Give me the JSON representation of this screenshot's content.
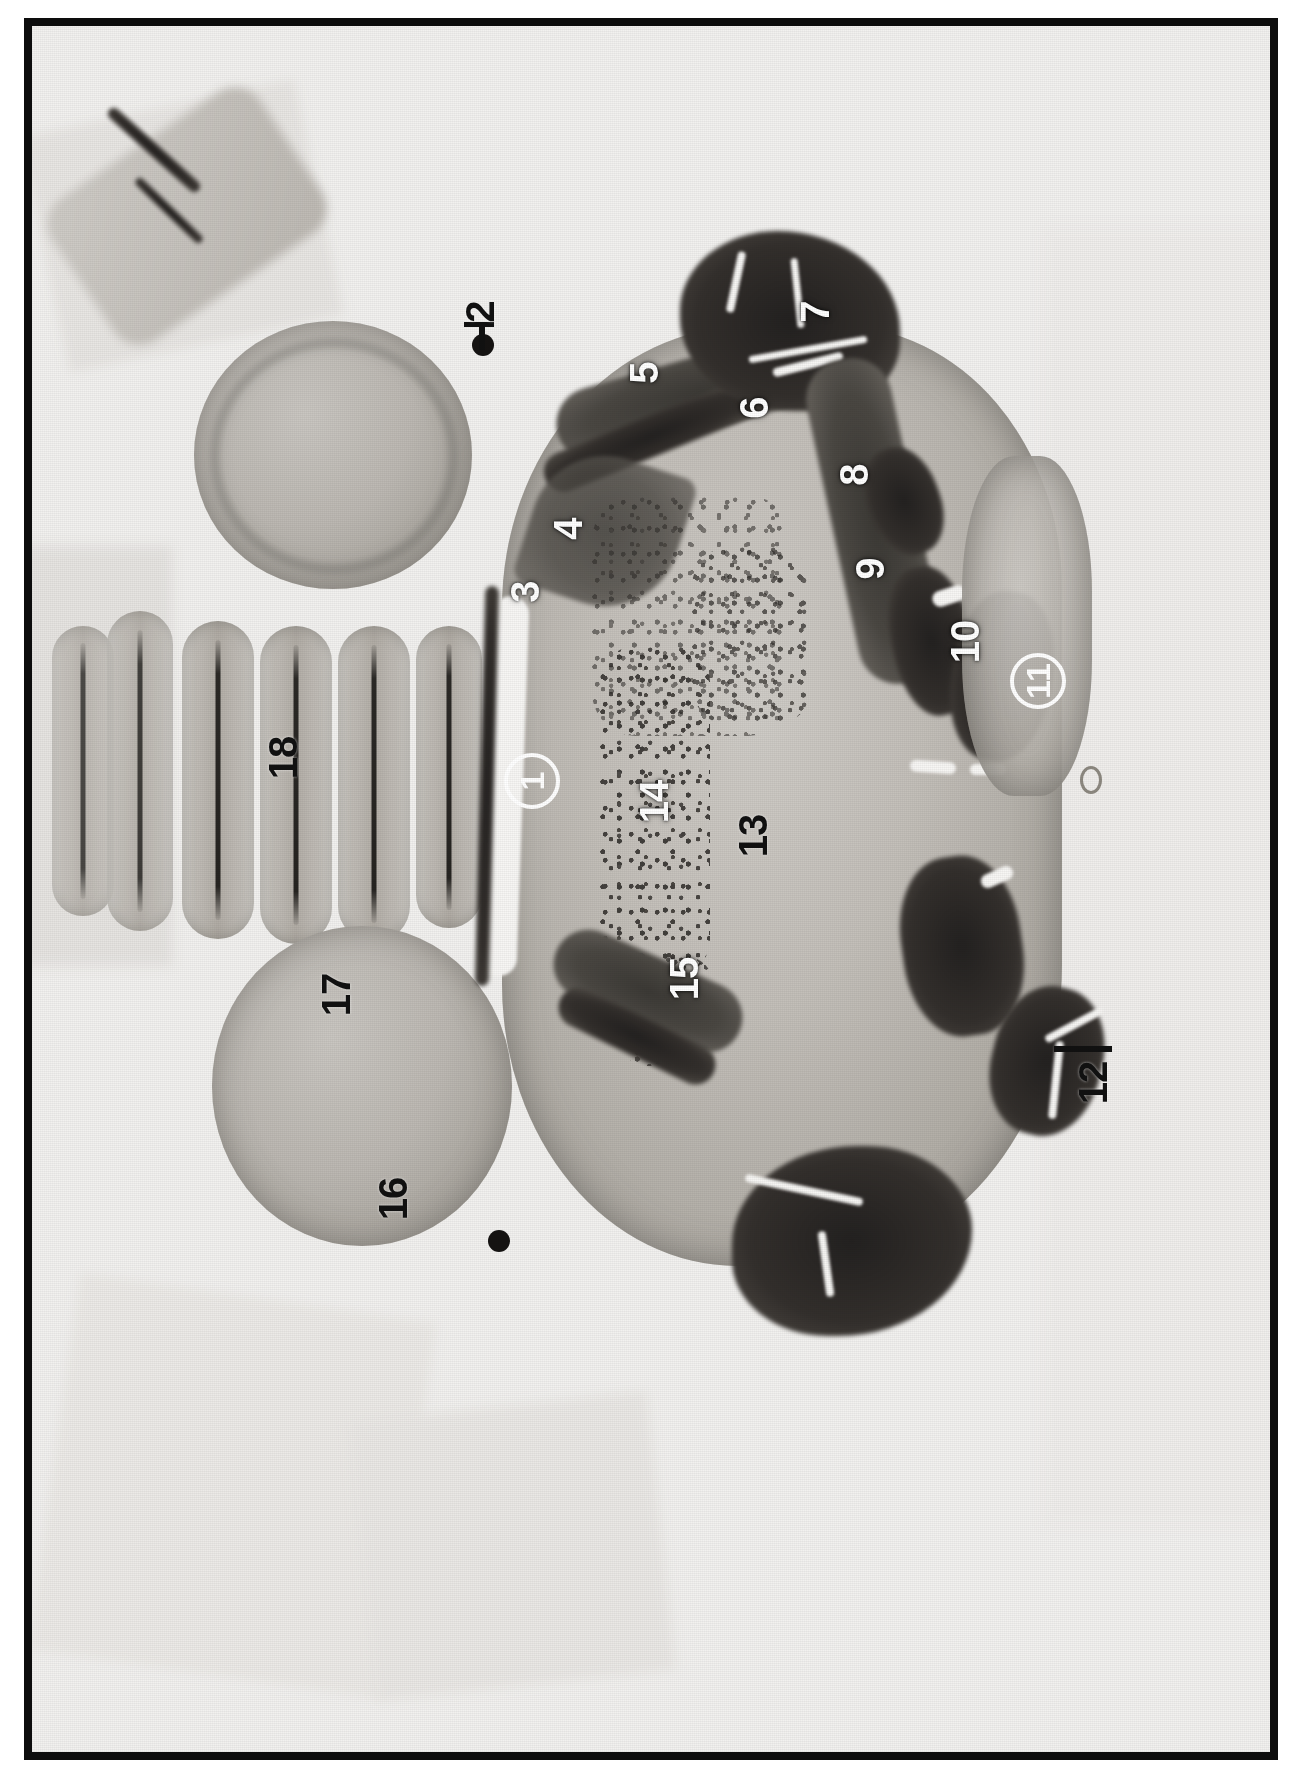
{
  "figure": {
    "kind": "histological-section-micrograph",
    "orientation": "rotated-90-ccw",
    "background_color": "#ffffff",
    "plate_border_color": "#0d0d0d",
    "tissue_tone": "grayscale"
  },
  "labels": [
    {
      "id": "1a",
      "text": "1",
      "style": "circled-white",
      "x": 500,
      "y": 755
    },
    {
      "id": "1b",
      "text": "1",
      "style": "circled-white",
      "x": 1006,
      "y": 655
    },
    {
      "id": "2",
      "text": "2",
      "style": "black",
      "x": 452,
      "y": 288
    },
    {
      "id": "3",
      "text": "3",
      "style": "white",
      "x": 495,
      "y": 568
    },
    {
      "id": "4",
      "text": "4",
      "style": "white",
      "x": 538,
      "y": 505
    },
    {
      "id": "5",
      "text": "5",
      "style": "white",
      "x": 614,
      "y": 349
    },
    {
      "id": "6",
      "text": "6",
      "style": "white",
      "x": 724,
      "y": 384
    },
    {
      "id": "7",
      "text": "7",
      "style": "white",
      "x": 785,
      "y": 288
    },
    {
      "id": "8",
      "text": "8",
      "style": "white",
      "x": 824,
      "y": 451
    },
    {
      "id": "9",
      "text": "9",
      "style": "white",
      "x": 840,
      "y": 545
    },
    {
      "id": "10",
      "text": "10",
      "style": "white",
      "x": 936,
      "y": 630
    },
    {
      "id": "11",
      "text": "11",
      "style": "circled-white",
      "x": 1006,
      "y": 655
    },
    {
      "id": "12",
      "text": "12",
      "style": "black",
      "x": 1063,
      "y": 1070
    },
    {
      "id": "13",
      "text": "13",
      "style": "black",
      "x": 724,
      "y": 823
    },
    {
      "id": "14",
      "text": "14",
      "style": "white",
      "x": 625,
      "y": 789
    },
    {
      "id": "15",
      "text": "15",
      "style": "white",
      "x": 655,
      "y": 966
    },
    {
      "id": "16",
      "text": "16",
      "style": "black",
      "x": 364,
      "y": 1186
    },
    {
      "id": "17",
      "text": "17",
      "style": "black",
      "x": 307,
      "y": 982
    },
    {
      "id": "18",
      "text": "18",
      "style": "black",
      "x": 254,
      "y": 745
    }
  ],
  "leaders": [
    {
      "id": "leader-2",
      "for": "2",
      "color": "#111111"
    },
    {
      "id": "leader-12",
      "for": "12",
      "color": "#111111"
    }
  ],
  "markers": [
    {
      "id": "marker-dot-2",
      "kind": "lesion-dot",
      "x": 450,
      "y": 318
    },
    {
      "id": "marker-dot-16",
      "kind": "lesion-dot",
      "x": 466,
      "y": 1215
    }
  ],
  "colors": {
    "plate_border": "#0d0d0d",
    "paper": "#f2f1ef",
    "tissue_light": "#c9c6c1",
    "tissue_mid": "#a19d96",
    "tissue_dark": "#3b3935",
    "tissue_darkest": "#232120",
    "label_white": "#ffffff",
    "label_black": "#111111"
  }
}
